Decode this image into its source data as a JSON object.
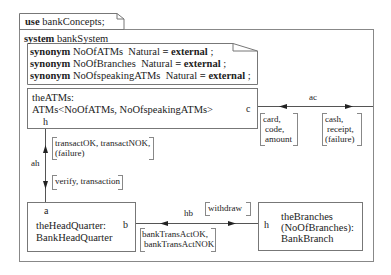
{
  "use_clause": {
    "keyword": "use",
    "package": "bankConcepts;"
  },
  "system": {
    "keyword": "system",
    "name": "bankSystem",
    "synonyms": [
      {
        "keyword": "synonym",
        "name": "NoOfATMs",
        "type": "Natural",
        "eq": "=",
        "value": "external",
        "end": ";"
      },
      {
        "keyword": "synonym",
        "name": "NoOfBranches",
        "type": "Natural",
        "eq": "=",
        "value": "external",
        "end": ";"
      },
      {
        "keyword": "synonym",
        "name": "NoOfspeakingATMs",
        "type": "Natural",
        "eq": "=",
        "value": "external",
        "end": ";"
      }
    ]
  },
  "blocks": {
    "atms": {
      "line1": "theATMs:",
      "line2": "ATMs<NoOfATMs, NoOfspeakingATMs>",
      "gate_h": "h",
      "gate_c": "c"
    },
    "headquarter": {
      "line1": "theHeadQuarter:",
      "line2": "BankHeadQuarter",
      "gate_a": "a",
      "gate_b": "b"
    },
    "branches": {
      "line1": "theBranches",
      "line2": "(NoOfBranches):",
      "line3": "BankBranch",
      "gate_h": "h"
    }
  },
  "channels": {
    "ac": {
      "label": "ac",
      "in_signals": [
        "card,",
        "code,",
        "amount"
      ],
      "out_signals": [
        "cash,",
        "receipt,",
        "(failure)"
      ]
    },
    "ah": {
      "label": "ah",
      "up_signals": [
        "transactOK, transactNOK,",
        "(failure)"
      ],
      "down_signals": [
        "verify, transaction"
      ]
    },
    "hb": {
      "label": "hb",
      "right_signals": [
        "withdraw"
      ],
      "left_signals": [
        "bankTransActOK,",
        "bankTransActNOK"
      ]
    }
  }
}
